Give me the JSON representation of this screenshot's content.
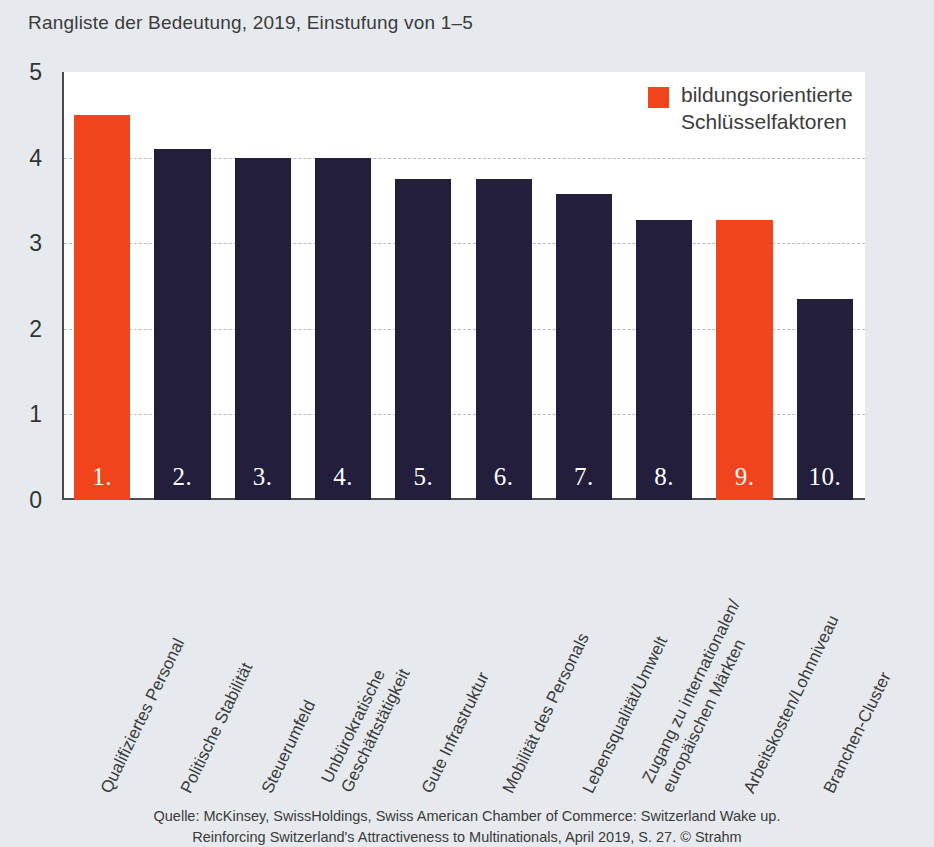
{
  "chart_data": {
    "type": "bar",
    "title": "Rangliste der Bedeutung, 2019, Einstufung von 1–5",
    "xlabel": "",
    "ylabel": "",
    "ylim": [
      0,
      5
    ],
    "yticks": [
      "5",
      "4",
      "3",
      "2",
      "1",
      "0"
    ],
    "grid": "horizontal-dashed",
    "legend_position": "top-right",
    "categories": [
      "Qualifiziertes Personal",
      "Politische Stabilität",
      "Steuerumfeld",
      "Unbürokratische\nGeschäftstätigkeit",
      "Gute Infrastruktur",
      "Mobilität des Personals",
      "Lebensqualität/Umwelt",
      "Zugang zu internationalen/\neuropäischen Märkten",
      "Arbeitskosten/Lohnniveau",
      "Branchen-Cluster"
    ],
    "values": [
      4.5,
      4.1,
      4.0,
      4.0,
      3.75,
      3.75,
      3.57,
      3.27,
      3.27,
      2.35
    ],
    "rank_labels": [
      "1.",
      "2.",
      "3.",
      "4.",
      "5.",
      "6.",
      "7.",
      "8.",
      "9.",
      "10."
    ],
    "highlighted_indices": [
      0,
      8
    ],
    "series": [
      {
        "name": "bildungsorientierte Schlüsselfaktoren",
        "color": "#f2441c",
        "values": [
          4.5,
          null,
          null,
          null,
          null,
          null,
          null,
          null,
          3.27,
          null
        ]
      },
      {
        "name": "übrige Schlüsselfaktoren",
        "color": "#221e3c",
        "values": [
          null,
          4.1,
          4.0,
          4.0,
          3.75,
          3.75,
          3.57,
          3.27,
          null,
          2.35
        ]
      }
    ]
  },
  "legend": {
    "label": "bildungsorientierte\nSchlüsselfaktoren",
    "swatch_color": "#f2441c"
  },
  "colors": {
    "highlight": "#f2441c",
    "bar": "#221e3c",
    "page_background": "#e6eaee",
    "plot_background": "#ffffff",
    "axis": "#4a4a55",
    "gridline": "#b9b9c4"
  },
  "source": {
    "text": "Quelle: McKinsey, SwissHoldings, Swiss American Chamber of Commerce: Switzerland Wake up.\nReinforcing Switzerland's Attractiveness to Multinationals, April 2019, S. 27. © Strahm"
  }
}
